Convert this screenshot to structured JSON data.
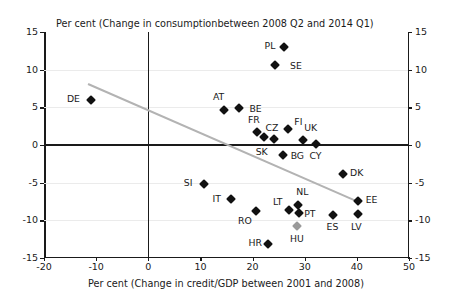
{
  "chart_data": {
    "type": "scatter",
    "title": "",
    "top_axis_title": "Per cent (Change in consumptionbetween 2008 Q2 and 2014 Q1)",
    "xlabel": "Per cent (Change in credit/GDP between 2001 and 2008)",
    "ylabel": "",
    "xlim": [
      -20,
      50
    ],
    "ylim": [
      -15,
      15
    ],
    "xticks": [
      -20,
      -10,
      0,
      10,
      20,
      30,
      40,
      50
    ],
    "yticks": [
      -15,
      -10,
      -5,
      0,
      5,
      10,
      15
    ],
    "xtick_labels": [
      "-20",
      "-10",
      "0",
      "10",
      "20",
      "30",
      "40",
      "50"
    ],
    "ytick_labels": [
      "-15",
      "-10",
      "-5",
      "0",
      "5",
      "10",
      "15"
    ],
    "grid": "horizontal-light",
    "legend": "none",
    "marker": "diamond",
    "points": [
      {
        "label": "DE",
        "x": -11.0,
        "y": 6.0,
        "lx": -15.6,
        "ly": 6.1,
        "color": "#111111"
      },
      {
        "label": "PL",
        "x": 26.0,
        "y": 13.0,
        "lx": 22.3,
        "ly": 13.1,
        "color": "#111111"
      },
      {
        "label": "SE",
        "x": 24.3,
        "y": 10.6,
        "lx": 27.2,
        "ly": 10.5,
        "color": "#111111"
      },
      {
        "label": "AT",
        "x": 14.6,
        "y": 4.7,
        "lx": 12.4,
        "ly": 6.4,
        "color": "#111111"
      },
      {
        "label": "BE",
        "x": 17.4,
        "y": 4.9,
        "lx": 19.4,
        "ly": 4.8,
        "color": "#111111"
      },
      {
        "label": "FR",
        "x": 20.8,
        "y": 1.7,
        "lx": 19.1,
        "ly": 3.3,
        "color": "#111111"
      },
      {
        "label": "SK",
        "x": 22.1,
        "y": 1.0,
        "lx": 20.6,
        "ly": -0.9,
        "color": "#111111"
      },
      {
        "label": "CZ",
        "x": 24.1,
        "y": 0.8,
        "lx": 22.5,
        "ly": 2.3,
        "color": "#111111"
      },
      {
        "label": "FI",
        "x": 26.8,
        "y": 2.1,
        "lx": 28.0,
        "ly": 3.0,
        "color": "#111111"
      },
      {
        "label": "UK",
        "x": 29.6,
        "y": 0.7,
        "lx": 29.9,
        "ly": 2.2,
        "color": "#111111"
      },
      {
        "label": "CY",
        "x": 32.2,
        "y": 0.1,
        "lx": 30.9,
        "ly": -1.5,
        "color": "#111111"
      },
      {
        "label": "BG",
        "x": 25.8,
        "y": -1.3,
        "lx": 27.3,
        "ly": -1.4,
        "color": "#111111"
      },
      {
        "label": "DK",
        "x": 37.4,
        "y": -3.8,
        "lx": 38.7,
        "ly": -3.7,
        "color": "#111111"
      },
      {
        "label": "SI",
        "x": 10.6,
        "y": -5.2,
        "lx": 6.8,
        "ly": -5.1,
        "color": "#111111"
      },
      {
        "label": "IT",
        "x": 15.8,
        "y": -7.2,
        "lx": 12.3,
        "ly": -7.2,
        "color": "#111111"
      },
      {
        "label": "EE",
        "x": 40.3,
        "y": -7.4,
        "lx": 41.7,
        "ly": -7.3,
        "color": "#111111"
      },
      {
        "label": "NL",
        "x": 28.8,
        "y": -8.0,
        "lx": 28.4,
        "ly": -6.2,
        "color": "#111111"
      },
      {
        "label": "LT",
        "x": 26.9,
        "y": -8.6,
        "lx": 23.9,
        "ly": -7.6,
        "color": "#111111"
      },
      {
        "label": "PT",
        "x": 28.9,
        "y": -9.0,
        "lx": 29.9,
        "ly": -9.1,
        "color": "#111111"
      },
      {
        "label": "RO",
        "x": 20.6,
        "y": -8.8,
        "lx": 17.2,
        "ly": -10.1,
        "color": "#111111"
      },
      {
        "label": "ES",
        "x": 35.5,
        "y": -9.3,
        "lx": 34.2,
        "ly": -10.9,
        "color": "#111111"
      },
      {
        "label": "LV",
        "x": 40.2,
        "y": -9.1,
        "lx": 38.9,
        "ly": -10.9,
        "color": "#111111"
      },
      {
        "label": "HU",
        "x": 28.6,
        "y": -10.8,
        "lx": 27.2,
        "ly": -12.5,
        "color": "#9a9a9a"
      },
      {
        "label": "HR",
        "x": 23.0,
        "y": -13.1,
        "lx": 19.2,
        "ly": -13.0,
        "color": "#111111"
      }
    ],
    "trendline": {
      "x0": -11.5,
      "y0": 8.2,
      "x1": 40.5,
      "y1": -7.5,
      "color": "#b3b3b3"
    }
  }
}
